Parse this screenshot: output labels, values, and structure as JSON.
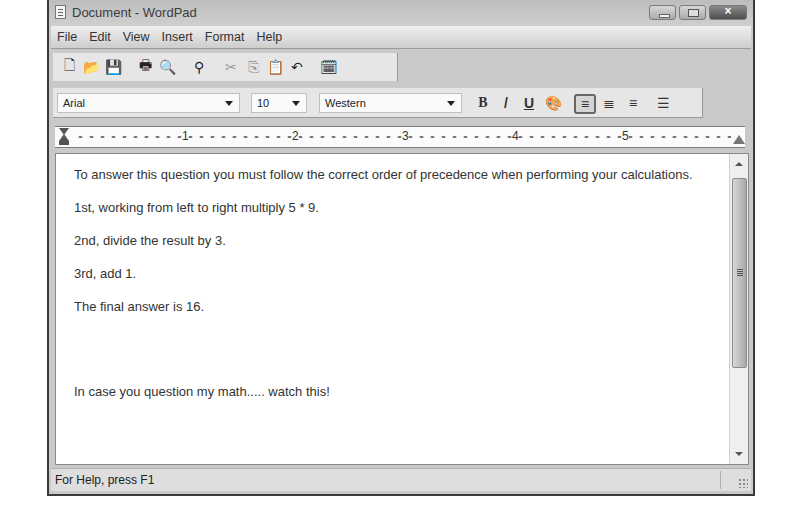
{
  "window": {
    "title": "Document - WordPad",
    "controls": {
      "minimize": "minimize",
      "maximize": "maximize",
      "close": "×"
    }
  },
  "menu": [
    "File",
    "Edit",
    "View",
    "Insert",
    "Format",
    "Help"
  ],
  "toolbar": {
    "icons": [
      {
        "name": "new-document-icon",
        "glyph": "🗋"
      },
      {
        "name": "open-folder-icon",
        "glyph": "📂"
      },
      {
        "name": "save-icon",
        "glyph": "💾"
      },
      {
        "name": "print-icon",
        "glyph": "🖶"
      },
      {
        "name": "print-preview-icon",
        "glyph": "🔍"
      },
      {
        "name": "find-binoculars-icon",
        "glyph": "⚲"
      },
      {
        "name": "cut-icon",
        "glyph": "✂"
      },
      {
        "name": "copy-icon",
        "glyph": "⎘"
      },
      {
        "name": "paste-icon",
        "glyph": "📋"
      },
      {
        "name": "undo-icon",
        "glyph": "↶"
      },
      {
        "name": "insert-datetime-icon",
        "glyph": "🗓"
      }
    ]
  },
  "format": {
    "font": "Arial",
    "size": "10",
    "script": "Western",
    "bold": "B",
    "italic": "/",
    "underline": "U",
    "color": "🎨",
    "align_left": "≡",
    "align_center": "≣",
    "align_right": "≡",
    "bullets": "☰"
  },
  "ruler": {
    "numbers": [
      "1",
      "2",
      "3",
      "4",
      "5"
    ]
  },
  "document": {
    "paragraphs": [
      "To answer this question you must follow the correct order of precedence when performing your calculations.",
      "1st, working from left to right multiply 5 * 9.",
      "2nd, divide the result by 3.",
      "3rd, add 1.",
      "The final answer is 16.",
      "In case you question my math..... watch this!"
    ]
  },
  "status": {
    "text": "For Help, press F1"
  }
}
